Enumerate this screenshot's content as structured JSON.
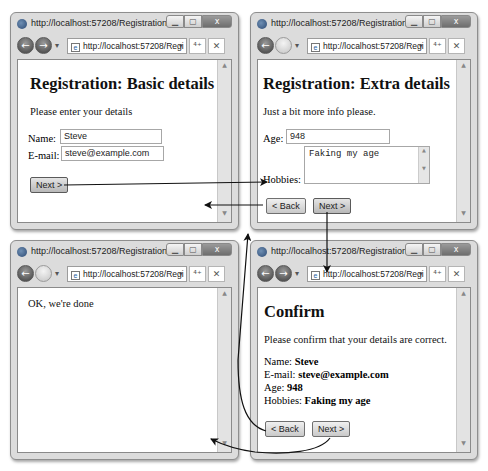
{
  "colors": {
    "window_frame": "#dcdcdc",
    "arrow": "#111111",
    "page_bg": "#ffffff"
  },
  "windows": {
    "basic": {
      "title": "http://localhost:57208/Registration/B...",
      "address": "http://localhost:57208/Regi",
      "heading": "Registration: Basic details",
      "intro": "Please enter your details",
      "fields": {
        "name_label": "Name:",
        "name_value": "Steve",
        "email_label": "E-mail:",
        "email_value": "steve@example.com"
      },
      "next_label": "Next >"
    },
    "extra": {
      "title": "http://localhost:57208/Registration/E...",
      "address": "http://localhost:57208/Regi",
      "heading": "Registration: Extra details",
      "intro": "Just a bit more info please.",
      "fields": {
        "age_label": "Age:",
        "age_value": "948",
        "hobbies_label": "Hobbies:",
        "hobbies_value": "Faking my age"
      },
      "back_label": "< Back",
      "next_label": "Next >"
    },
    "done": {
      "title": "http://localhost:57208/Registration/C...",
      "address": "http://localhost:57208/Regi",
      "message": "OK, we're done"
    },
    "confirm": {
      "title": "http://localhost:57208/Registration/C...",
      "address": "http://localhost:57208/Regi",
      "heading": "Confirm",
      "intro": "Please confirm that your details are correct.",
      "details": [
        {
          "label": "Name:",
          "value": "Steve"
        },
        {
          "label": "E-mail:",
          "value": "steve@example.com"
        },
        {
          "label": "Age:",
          "value": "948"
        },
        {
          "label": "Hobbies:",
          "value": "Faking my age"
        }
      ],
      "back_label": "< Back",
      "next_label": "Next >"
    }
  },
  "chrome": {
    "back_glyph": "←",
    "forward_glyph": "→",
    "dropdown_glyph": "▾",
    "refresh_glyph": "⁴⁺",
    "stop_glyph": "✕",
    "min_glyph": "▁",
    "max_glyph": "▢",
    "close_glyph": "x",
    "scroll_up": "▲",
    "scroll_down": "▼"
  }
}
